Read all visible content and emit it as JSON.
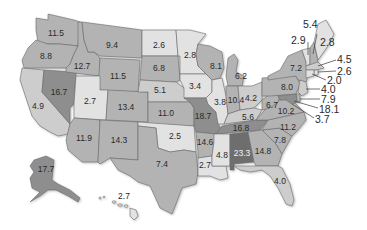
{
  "map": {
    "type": "choropleth",
    "region": "United States",
    "colors": {
      "very_light": "#e2e2e2",
      "light": "#cdcdcd",
      "medium": "#b3b3b3",
      "dark": "#8e8e8e",
      "darkest": "#6e6e6e",
      "border": "#6a6a6a"
    },
    "states": [
      {
        "id": "WA",
        "value": "11.5",
        "shade": "medium"
      },
      {
        "id": "OR",
        "value": "8.8",
        "shade": "medium"
      },
      {
        "id": "CA",
        "value": "4.9",
        "shade": "light"
      },
      {
        "id": "NV",
        "value": "16.7",
        "shade": "dark"
      },
      {
        "id": "ID",
        "value": "12.7",
        "shade": "medium"
      },
      {
        "id": "MT",
        "value": "9.4",
        "shade": "medium"
      },
      {
        "id": "WY",
        "value": "11.5",
        "shade": "medium"
      },
      {
        "id": "UT",
        "value": "2.7",
        "shade": "very_light"
      },
      {
        "id": "AZ",
        "value": "11.9",
        "shade": "medium"
      },
      {
        "id": "CO",
        "value": "13.4",
        "shade": "medium"
      },
      {
        "id": "NM",
        "value": "14.3",
        "shade": "medium"
      },
      {
        "id": "ND",
        "value": "2.6",
        "shade": "very_light"
      },
      {
        "id": "SD",
        "value": "6.8",
        "shade": "medium"
      },
      {
        "id": "NE",
        "value": "5.1",
        "shade": "light"
      },
      {
        "id": "KS",
        "value": "11.0",
        "shade": "medium"
      },
      {
        "id": "OK",
        "value": "2.5",
        "shade": "very_light"
      },
      {
        "id": "TX",
        "value": "7.4",
        "shade": "medium"
      },
      {
        "id": "MN",
        "value": "2.8",
        "shade": "very_light"
      },
      {
        "id": "IA",
        "value": "3.4",
        "shade": "very_light"
      },
      {
        "id": "MO",
        "value": "18.7",
        "shade": "dark"
      },
      {
        "id": "AR",
        "value": "14.6",
        "shade": "medium"
      },
      {
        "id": "LA",
        "value": "2.7",
        "shade": "very_light"
      },
      {
        "id": "WI",
        "value": "8.1",
        "shade": "medium"
      },
      {
        "id": "IL",
        "value": "3.8",
        "shade": "very_light"
      },
      {
        "id": "MI",
        "value": "6.2",
        "shade": "medium"
      },
      {
        "id": "IN",
        "value": "10.4",
        "shade": "medium"
      },
      {
        "id": "OH",
        "value": "4.2",
        "shade": "light"
      },
      {
        "id": "KY",
        "value": "5.6",
        "shade": "light"
      },
      {
        "id": "TN",
        "value": "16.8",
        "shade": "dark"
      },
      {
        "id": "MS",
        "value": "4.8",
        "shade": "very_light"
      },
      {
        "id": "AL",
        "value": "23.3",
        "shade": "darkest"
      },
      {
        "id": "GA",
        "value": "14.8",
        "shade": "medium"
      },
      {
        "id": "FL",
        "value": "4.0",
        "shade": "light"
      },
      {
        "id": "SC",
        "value": "7.8",
        "shade": "medium"
      },
      {
        "id": "NC",
        "value": "11.2",
        "shade": "medium"
      },
      {
        "id": "VA",
        "value": "10.2",
        "shade": "medium"
      },
      {
        "id": "WV",
        "value": "6.7",
        "shade": "medium"
      },
      {
        "id": "PA",
        "value": "8.0",
        "shade": "medium"
      },
      {
        "id": "NY",
        "value": "7.2",
        "shade": "medium"
      },
      {
        "id": "VT",
        "value": "2.9",
        "shade": "very_light"
      },
      {
        "id": "NH",
        "value": "5.4",
        "shade": "medium"
      },
      {
        "id": "ME",
        "value": "2.8",
        "shade": "very_light"
      },
      {
        "id": "MA",
        "value": "4.5",
        "shade": "light"
      },
      {
        "id": "RI",
        "value": "2.6",
        "shade": "very_light"
      },
      {
        "id": "CT",
        "value": "2.0",
        "shade": "very_light"
      },
      {
        "id": "NJ",
        "value": "4.0",
        "shade": "light"
      },
      {
        "id": "DE",
        "value": "7.9",
        "shade": "medium"
      },
      {
        "id": "MD",
        "value": "18.1",
        "shade": "dark"
      },
      {
        "id": "DC",
        "value": "3.7",
        "shade": "very_light"
      },
      {
        "id": "AK",
        "value": "17.7",
        "shade": "dark"
      },
      {
        "id": "HI",
        "value": "2.7",
        "shade": "very_light"
      }
    ],
    "callouts": [
      {
        "state": "NH",
        "value": "5.4"
      },
      {
        "state": "VT",
        "value": "2.9"
      },
      {
        "state": "ME",
        "value": "2.8"
      },
      {
        "state": "MA",
        "value": "4.5"
      },
      {
        "state": "RI",
        "value": "2.6"
      },
      {
        "state": "CT",
        "value": "2.0"
      },
      {
        "state": "NJ",
        "value": "4.0"
      },
      {
        "state": "DE",
        "value": "7.9"
      },
      {
        "state": "MD",
        "value": "18.1"
      },
      {
        "state": "DC",
        "value": "3.7"
      }
    ]
  }
}
